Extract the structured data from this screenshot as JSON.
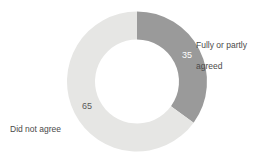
{
  "chart_data": {
    "type": "pie",
    "variant": "donut",
    "title": "",
    "subtitle": "",
    "xlabel": "",
    "ylabel": "",
    "legend_position": "callout-labels",
    "grid": false,
    "total": 100,
    "units": "percent",
    "categories": [
      "Fully or partly agreed",
      "Did not agree"
    ],
    "values": [
      35,
      65
    ],
    "value_labels": [
      "35",
      "65"
    ],
    "colors": [
      "#9a9a9a",
      "#e6e6e4"
    ],
    "start_angle_deg": 0,
    "direction": "clockwise",
    "slices": [
      {
        "label": "Fully or partly agreed",
        "label_line_1": "Fully or partly",
        "label_line_2": "agreed",
        "value": 35,
        "value_label": "35",
        "color": "#9a9a9a",
        "value_text_color": "#ffffff",
        "start_deg": 0,
        "end_deg": 126
      },
      {
        "label": "Did not agree",
        "label_line_1": "Did not agree",
        "label_line_2": "",
        "value": 65,
        "value_label": "65",
        "color": "#e6e6e4",
        "value_text_color": "#5a5a5a",
        "start_deg": 126,
        "end_deg": 360
      }
    ],
    "geometry": {
      "center_x": 137,
      "center_y": 81.5,
      "outer_radius": 70,
      "inner_radius": 42
    },
    "background_color": "#ffffff",
    "label_text_color": "#4a4a4a"
  }
}
